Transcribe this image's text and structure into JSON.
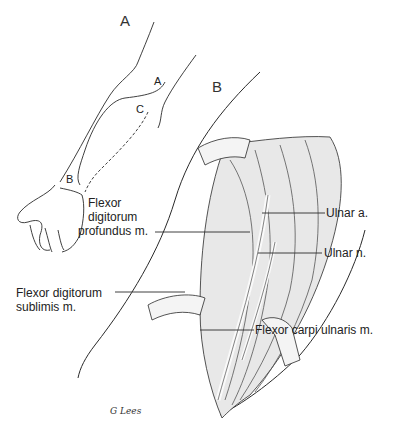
{
  "figure": {
    "panels": [
      {
        "id": "A",
        "label": "A"
      },
      {
        "id": "B",
        "label": "B"
      }
    ],
    "panel_a_markers": [
      "A",
      "C",
      "B"
    ],
    "labels": {
      "flexor_digitorum_profundus": [
        "Flexor",
        "digitorum",
        "profundus m."
      ],
      "flexor_digitorum_sublimis": [
        "Flexor digitorum",
        "sublimis m."
      ],
      "ulnar_artery": "Ulnar a.",
      "ulnar_nerve": "Ulnar n.",
      "flexor_carpi_ulnaris": "Flexor carpi ulnaris m."
    },
    "signature": "G Lees",
    "colors": {
      "line": "#2a2a2a",
      "muscle_shade": "#8a8a8a",
      "background": "#ffffff"
    }
  }
}
